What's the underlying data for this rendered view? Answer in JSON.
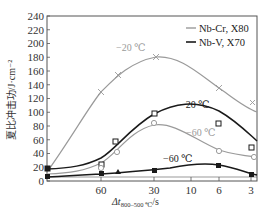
{
  "chart_data": {
    "type": "line",
    "title": "",
    "xlabel": "Δt800–500 ℃/s",
    "ylabel": "夏比冲击功/J·cm⁻²",
    "ylim": [
      0,
      240
    ],
    "yticks": [
      0,
      20,
      40,
      60,
      80,
      100,
      120,
      140,
      160,
      180,
      200,
      220,
      240
    ],
    "x_tick_labels": [
      "60",
      "30",
      "10",
      "6",
      "3"
    ],
    "x_axis_reversed_log": true,
    "grid": false,
    "legend_position": "upper right",
    "legend": [
      {
        "label": "Nb-Cr, X80",
        "color": "#9a9a9a"
      },
      {
        "label": "Nb-V, X70",
        "color": "#1a1a1a"
      }
    ],
    "series": [
      {
        "name": "Nb-Cr, X80 −20 ℃",
        "color": "#9a9a9a",
        "marker": "x",
        "x": [
          100,
          60,
          45,
          30,
          6,
          3
        ],
        "values": [
          15,
          130,
          153,
          180,
          135,
          110
        ]
      },
      {
        "name": "Nb-V, X70 −20 ℃",
        "color": "#1a1a1a",
        "marker": "open-square",
        "x": [
          100,
          60,
          45,
          30,
          6,
          3
        ],
        "values": [
          18,
          25,
          57,
          82,
          83,
          48
        ]
      },
      {
        "name": "Nb-Cr, X80 −60 ℃",
        "color": "#9a9a9a",
        "marker": "open-circle",
        "x": [
          100,
          60,
          45,
          30,
          6,
          3
        ],
        "values": [
          10,
          20,
          42,
          84,
          44,
          35
        ]
      },
      {
        "name": "Nb-V, X70 −60 ℃",
        "color": "#1a1a1a",
        "marker": "filled-square",
        "x": [
          100,
          60,
          45,
          30,
          6,
          3
        ],
        "values": [
          6,
          10,
          9,
          16,
          23,
          9
        ]
      }
    ],
    "annotations": [
      {
        "text": "−20 ℃",
        "near": "Nb-Cr −20 ℃ peak"
      },
      {
        "text": "−20 ℃",
        "near": "Nb-V −20 ℃ peak"
      },
      {
        "text": "−60 ℃",
        "near": "Nb-Cr −60 ℃ curve"
      },
      {
        "text": "−60 ℃",
        "near": "Nb-V −60 ℃ curve"
      }
    ]
  },
  "labels": {
    "ylabel": "夏比冲击功/J·cm⁻²",
    "xlabel_main": "Δt",
    "xlabel_sub": "800–500 ℃",
    "xlabel_unit": "/s",
    "ann_grey_20": "−20 ℃",
    "ann_black_20": "−20 ℃",
    "ann_grey_60": "−60 ℃",
    "ann_black_60": "−60 ℃",
    "legend_1": "Nb-Cr, X80",
    "legend_2": "Nb-V, X70"
  }
}
